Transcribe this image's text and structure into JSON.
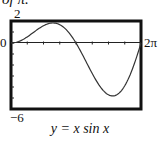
{
  "page": {
    "top_fragment": "of π."
  },
  "chart_data": {
    "type": "line",
    "title": "",
    "caption": "y = x sin x",
    "function": "y = x*sin(x)",
    "xlabel": "",
    "ylabel": "",
    "xlim": [
      0,
      6.2832
    ],
    "ylim": [
      -6,
      2
    ],
    "x_tick_labels": {
      "left": "0",
      "right": "2π"
    },
    "y_tick_labels": {
      "top": "2",
      "bottom": "-6"
    },
    "x_ticks_count": 8,
    "y_ticks_count": 8,
    "grid": false,
    "series": [
      {
        "name": "y = x sin x",
        "x": [
          0,
          0.5,
          1.0,
          1.5,
          2.03,
          2.5,
          3.14,
          3.5,
          4.0,
          4.5,
          4.91,
          5.5,
          6.0,
          6.28
        ],
        "values": [
          0,
          0.24,
          0.84,
          1.5,
          1.82,
          1.5,
          0,
          -1.23,
          -3.03,
          -4.4,
          -4.81,
          -3.88,
          -1.68,
          0
        ]
      }
    ],
    "extrema": {
      "max": {
        "x": 2.03,
        "y": 1.82
      },
      "min": {
        "x": 4.91,
        "y": -4.81
      }
    }
  },
  "labels": {
    "y_top": "2",
    "y_bottom": "−6",
    "x_left": "0",
    "x_right": "2π",
    "caption": "y = x sin x"
  }
}
